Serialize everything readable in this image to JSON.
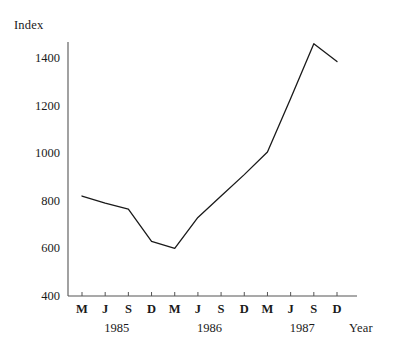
{
  "chart_data": {
    "type": "line",
    "title": "",
    "subtitle": "",
    "ylabel": "Index",
    "xlabel": "Year",
    "ylim": [
      400,
      1500
    ],
    "yticks": [
      400,
      600,
      800,
      1000,
      1200,
      1400
    ],
    "ytick_labels": [
      "400",
      "600",
      "800",
      "1000",
      "1200",
      "1400"
    ],
    "grid": false,
    "legend": null,
    "categories": [
      "M",
      "J",
      "S",
      "D",
      "M",
      "J",
      "S",
      "D",
      "M",
      "J",
      "S",
      "D"
    ],
    "x": [
      "M 1985",
      "J 1985",
      "S 1985",
      "D 1985",
      "M 1986",
      "J 1986",
      "S 1986",
      "D 1986",
      "M 1987",
      "J 1987",
      "S 1987",
      "D 1987"
    ],
    "values": [
      820,
      790,
      765,
      630,
      600,
      730,
      820,
      910,
      1005,
      1230,
      1460,
      1385
    ],
    "year_groups": [
      {
        "label": "1985",
        "start_index": 0,
        "end_index": 3
      },
      {
        "label": "1986",
        "start_index": 4,
        "end_index": 7
      },
      {
        "label": "1987",
        "start_index": 8,
        "end_index": 11
      }
    ],
    "line_color": "#1a1a1a",
    "axis_color": "#555555"
  }
}
